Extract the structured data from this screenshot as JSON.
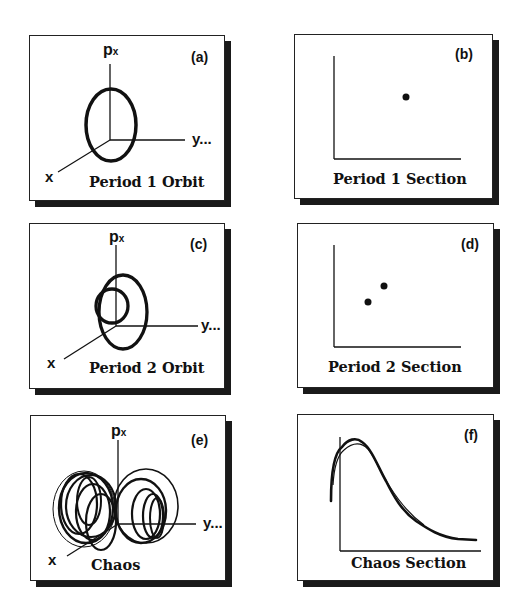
{
  "figure": {
    "panels": [
      {
        "id": "a",
        "tag": "(a)",
        "caption": "Period 1 Orbit",
        "type": "phase-space-3d",
        "axis_vertical": "p",
        "axis_vertical_sub": "x",
        "axis_right": "y...",
        "axis_diag": "x"
      },
      {
        "id": "b",
        "tag": "(b)",
        "caption": "Period 1 Section",
        "type": "poincare-section"
      },
      {
        "id": "c",
        "tag": "(c)",
        "caption": "Period 2 Orbit",
        "type": "phase-space-3d",
        "axis_vertical": "p",
        "axis_vertical_sub": "x",
        "axis_right": "y...",
        "axis_diag": "x"
      },
      {
        "id": "d",
        "tag": "(d)",
        "caption": "Period 2 Section",
        "type": "poincare-section"
      },
      {
        "id": "e",
        "tag": "(e)",
        "caption": "Chaos",
        "type": "phase-space-3d",
        "axis_vertical": "p",
        "axis_vertical_sub": "x",
        "axis_right": "y...",
        "axis_diag": "x"
      },
      {
        "id": "f",
        "tag": "(f)",
        "caption": "Chaos Section",
        "type": "poincare-section"
      }
    ],
    "colors": {
      "ink": "#111111",
      "shadow": "#1a1a1a",
      "background": "#ffffff"
    }
  }
}
